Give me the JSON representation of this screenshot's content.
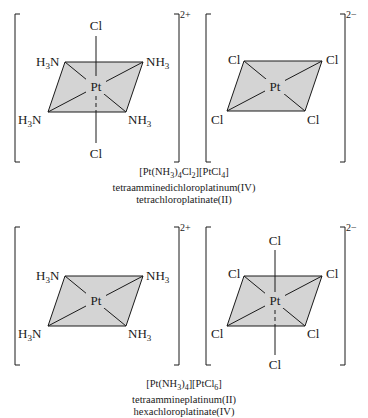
{
  "top": {
    "cation": {
      "charge": "2+",
      "center": "Pt",
      "axial_top": "Cl",
      "axial_bottom": "Cl",
      "eq_top_left": "H3N",
      "eq_top_right": "NH3",
      "eq_bottom_left": "H3N",
      "eq_bottom_right": "NH3"
    },
    "anion": {
      "charge": "2−",
      "center": "Pt",
      "eq_top_left": "Cl",
      "eq_top_right": "Cl",
      "eq_bottom_left": "Cl",
      "eq_bottom_right": "Cl"
    },
    "caption": {
      "formula": "[Pt(NH3)4Cl2][PtCl4]",
      "name_line1": "tetraamminedichloroplatinum(IV)",
      "name_line2": "tetrachloroplatinate(II)"
    }
  },
  "bottom": {
    "cation": {
      "charge": "2+",
      "center": "Pt",
      "eq_top_left": "H3N",
      "eq_top_right": "NH3",
      "eq_bottom_left": "H3N",
      "eq_bottom_right": "NH3"
    },
    "anion": {
      "charge": "2−",
      "center": "Pt",
      "axial_top": "Cl",
      "axial_bottom": "Cl",
      "eq_top_left": "Cl",
      "eq_top_right": "Cl",
      "eq_bottom_left": "Cl",
      "eq_bottom_right": "Cl"
    },
    "caption": {
      "formula": "[Pt(NH3)4][PtCl6]",
      "name_line1": "tetraammineplatinum(II)",
      "name_line2": "hexachloroplatinate(IV)"
    }
  }
}
